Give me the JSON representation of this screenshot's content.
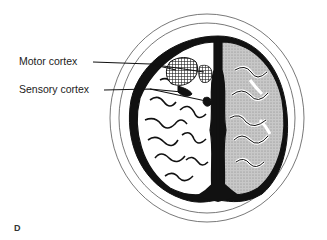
{
  "figure": {
    "panel_letter": "D",
    "labels": [
      {
        "id": "motor",
        "text": "Motor cortex"
      },
      {
        "id": "sensory",
        "text": "Sensory cortex"
      }
    ],
    "colors": {
      "ink": "#111111",
      "outline": "#555555",
      "background": "#ffffff",
      "gray_matter_shade": "#bdbdbd"
    }
  }
}
